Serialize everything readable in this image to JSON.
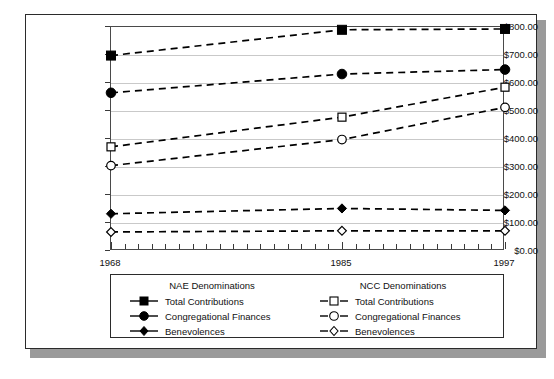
{
  "chart_data": {
    "type": "line",
    "title": "",
    "subtitle": "",
    "xlabel": "",
    "ylabel": "",
    "x": [
      1968,
      1985,
      1997
    ],
    "categories": [
      "1968",
      "1985",
      "1997"
    ],
    "xlim": [
      1968,
      1997
    ],
    "ylim": [
      0,
      800
    ],
    "grid": true,
    "legend_position": "bottom",
    "y_ticks": [
      {
        "value": 800,
        "label": "$800.00"
      },
      {
        "value": 700,
        "label": "$700.00"
      },
      {
        "value": 600,
        "label": "$600.00"
      },
      {
        "value": 500,
        "label": "$500.00"
      },
      {
        "value": 400,
        "label": "$400.00"
      },
      {
        "value": 300,
        "label": "$300.00"
      },
      {
        "value": 200,
        "label": "$200.00"
      },
      {
        "value": 100,
        "label": "$100.00"
      },
      {
        "value": 0,
        "label": "$0.00"
      }
    ],
    "x_tick_labels": [
      "1968",
      "1985",
      "1997"
    ],
    "series": [
      {
        "name": "Total Contributions",
        "group": "NAE Denominations",
        "marker": "square",
        "fill": "filled",
        "color": "#000000",
        "values": [
          698,
          790,
          793
        ]
      },
      {
        "name": "Congregational Finances",
        "group": "NAE Denominations",
        "marker": "circle",
        "fill": "filled",
        "color": "#000000",
        "values": [
          565,
          632,
          648
        ]
      },
      {
        "name": "Benevolences",
        "group": "NAE Denominations",
        "marker": "diamond",
        "fill": "filled",
        "color": "#000000",
        "values": [
          133,
          152,
          145
        ]
      },
      {
        "name": "Total Contributions",
        "group": "NCC Denominations",
        "marker": "square",
        "fill": "open",
        "color": "#000000",
        "values": [
          372,
          478,
          585
        ]
      },
      {
        "name": "Congregational Finances",
        "group": "NCC Denominations",
        "marker": "circle",
        "fill": "open",
        "color": "#000000",
        "values": [
          305,
          398,
          513
        ]
      },
      {
        "name": "Benevolences",
        "group": "NCC Denominations",
        "marker": "diamond",
        "fill": "open",
        "color": "#000000",
        "values": [
          68,
          72,
          72
        ]
      }
    ]
  },
  "legend": {
    "left_group_title": "NAE Denominations",
    "right_group_title": "NCC Denominations",
    "nae_total_label": "Total Contributions",
    "nae_congregational_label": "Congregational Finances",
    "nae_benevolences_label": "Benevolences",
    "ncc_total_label": "Total Contributions",
    "ncc_congregational_label": "Congregational Finances",
    "ncc_benevolences_label": "Benevolences"
  },
  "style": {
    "line_color": "#000000",
    "grid_color": "#c9c9c9",
    "axis_color": "#4a4a4a",
    "frame_color": "#2b2b2b",
    "shadow_color": "#9a9a9a",
    "background": "#ffffff"
  }
}
